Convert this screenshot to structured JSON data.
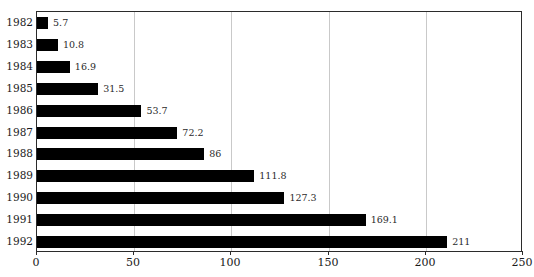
{
  "chart_data": {
    "type": "bar",
    "orientation": "horizontal",
    "xlabel": "",
    "ylabel": "",
    "categories": [
      "1982",
      "1983",
      "1984",
      "1985",
      "1986",
      "1987",
      "1988",
      "1989",
      "1990",
      "1991",
      "1992"
    ],
    "values": [
      5.7,
      10.8,
      16.9,
      31.5,
      53.7,
      72.2,
      86,
      111.8,
      127.3,
      169.1,
      211
    ],
    "value_labels": [
      "5.7",
      "10.8",
      "16.9",
      "31.5",
      "53.7",
      "72.2",
      "86",
      "111.8",
      "127.3",
      "169.1",
      "211"
    ],
    "xlim": [
      0,
      250
    ],
    "xticks": [
      0,
      50,
      100,
      150,
      200,
      250
    ],
    "xtick_labels": [
      "0",
      "50",
      "100",
      "150",
      "200",
      "250"
    ],
    "grid": "vertical-only",
    "legend": "none",
    "bar_color": "#000000",
    "gridline_color": "#c9c9c9",
    "frame_color": "#2b2b2b"
  }
}
